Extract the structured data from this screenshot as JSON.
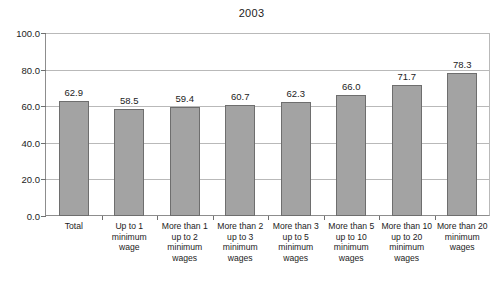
{
  "chart_data": {
    "type": "bar",
    "title": "2003",
    "xlabel": "",
    "ylabel": "",
    "ylim": [
      0.0,
      100.0
    ],
    "ytick_labels": [
      "100.0",
      "80.0",
      "60.0",
      "40.0",
      "20.0",
      "0.0"
    ],
    "ytick_values": [
      100.0,
      80.0,
      60.0,
      40.0,
      20.0,
      0.0
    ],
    "grid": true,
    "legend": "none",
    "categories": [
      "Total",
      "Up to 1 minimum wage",
      "More than 1 up to 2 minimum wages",
      "More than 2 up to 3 minimum wages",
      "More than 3 up to 5 minimum wages",
      "More than 5 up to 10 minimum wages",
      "More than 10 up to 20 minimum wages",
      "More than 20 minimum wages"
    ],
    "category_lines": [
      [
        "Total"
      ],
      [
        "Up to 1",
        "minimum",
        "wage"
      ],
      [
        "More than 1",
        "up to 2",
        "minimum",
        "wages"
      ],
      [
        "More than 2",
        "up to 3",
        "minimum",
        "wages"
      ],
      [
        "More than 3",
        "up to 5",
        "minimum",
        "wages"
      ],
      [
        "More than 5",
        "up to 10",
        "minimum",
        "wages"
      ],
      [
        "More than 10",
        "up to 20",
        "minimum",
        "wages"
      ],
      [
        "More than 20",
        "minimum",
        "wages"
      ]
    ],
    "values": [
      62.9,
      58.5,
      59.4,
      60.7,
      62.3,
      66.0,
      71.7,
      78.3
    ],
    "value_labels": [
      "62.9",
      "58.5",
      "59.4",
      "60.7",
      "62.3",
      "66.0",
      "71.7",
      "78.3"
    ],
    "colors": {
      "bar_fill": "#a3a3a3",
      "bar_border": "#6e6e6e",
      "grid": "#b9b9b9",
      "axis": "#8d8d8d",
      "text": "#1c1c1c",
      "background": "#ffffff"
    }
  }
}
